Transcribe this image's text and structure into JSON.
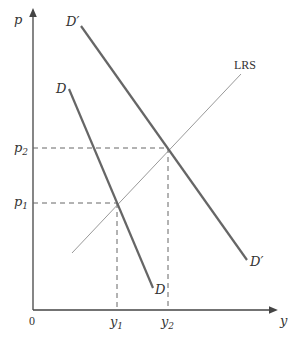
{
  "diagram": {
    "type": "supply-demand",
    "axes": {
      "y_label": "p",
      "x_label": "y",
      "origin_label": "0"
    },
    "curves": {
      "demand_original": {
        "label": "D",
        "end_label": "D"
      },
      "demand_shifted": {
        "label": "D′",
        "end_label": "D′"
      },
      "long_run_supply": {
        "label": "LRS"
      }
    },
    "price_ticks": [
      {
        "base": "p",
        "sub": "1"
      },
      {
        "base": "p",
        "sub": "2"
      }
    ],
    "quantity_ticks": [
      {
        "base": "y",
        "sub": "1"
      },
      {
        "base": "y",
        "sub": "2"
      }
    ],
    "colors": {
      "axis": "#444444",
      "demand": "#666666",
      "lrs": "#999999",
      "dashed": "#666666",
      "text": "#333333"
    }
  }
}
